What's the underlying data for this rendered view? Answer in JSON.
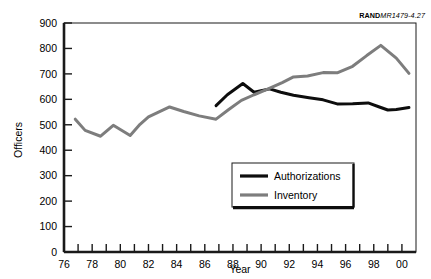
{
  "source_note": {
    "bold": "RAND",
    "italic": "MR1479-4.27"
  },
  "chart_data": {
    "type": "line",
    "title": "",
    "xlabel": "Year",
    "ylabel": "Officers",
    "xlim": [
      76,
      101
    ],
    "ylim": [
      0,
      900
    ],
    "ytick_step": 100,
    "yticks": [
      0,
      100,
      200,
      300,
      400,
      500,
      600,
      700,
      800,
      900
    ],
    "ytick_labels": [
      "0",
      "100",
      "200",
      "300",
      "400",
      "500",
      "600",
      "700",
      "800",
      "900"
    ],
    "xticks": [
      76,
      77,
      78,
      79,
      80,
      81,
      82,
      83,
      84,
      85,
      86,
      87,
      88,
      89,
      90,
      91,
      92,
      93,
      94,
      95,
      96,
      97,
      98,
      99,
      100
    ],
    "xtick_labels_major": [
      "76",
      "78",
      "80",
      "82",
      "84",
      "86",
      "88",
      "90",
      "92",
      "94",
      "96",
      "98",
      "00"
    ],
    "xticks_major": [
      76,
      78,
      80,
      82,
      84,
      86,
      88,
      90,
      92,
      94,
      96,
      98,
      100
    ],
    "grid": false,
    "legend_position": "center-right-lower",
    "series": [
      {
        "name": "Authorizations",
        "color": "#0d0d0d",
        "x": [
          86.8,
          87.6,
          88.7,
          89.5,
          90.0,
          90.6,
          91.4,
          92.3,
          93.4,
          94.4,
          95.4,
          96.5,
          97.6,
          98.4,
          99.0,
          99.6,
          100.5
        ],
        "values": [
          575,
          618,
          662,
          628,
          634,
          641,
          628,
          616,
          606,
          598,
          582,
          583,
          586,
          570,
          558,
          560,
          568
        ]
      },
      {
        "name": "Inventory",
        "color": "#7d7d7d",
        "x": [
          76.8,
          77.5,
          78.6,
          79.5,
          80.7,
          81.4,
          82.0,
          83.5,
          84.5,
          85.6,
          86.8,
          87.7,
          88.6,
          89.5,
          90.5,
          91.5,
          92.3,
          93.3,
          94.4,
          95.4,
          96.5,
          97.5,
          98.5,
          99.6,
          100.5
        ],
        "values": [
          522,
          478,
          455,
          498,
          458,
          502,
          531,
          570,
          552,
          535,
          522,
          560,
          596,
          618,
          641,
          666,
          688,
          692,
          705,
          704,
          730,
          772,
          812,
          762,
          702
        ]
      }
    ]
  },
  "legend": {
    "items": [
      {
        "label": "Authorizations",
        "color": "#0d0d0d",
        "width": 3.2
      },
      {
        "label": "Inventory",
        "color": "#7d7d7d",
        "width": 3.2
      }
    ]
  }
}
